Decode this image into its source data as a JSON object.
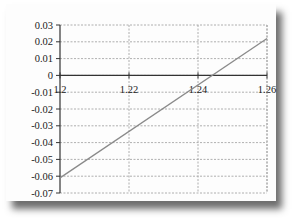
{
  "chart_data": {
    "type": "line",
    "title": "",
    "xlabel": "",
    "ylabel": "",
    "x": [
      1.2,
      1.26
    ],
    "series": [
      {
        "name": "line",
        "values": [
          -0.061,
          0.022
        ],
        "color": "#8a8a8a"
      }
    ],
    "xlim": [
      1.2,
      1.26
    ],
    "ylim": [
      -0.07,
      0.03
    ],
    "x_ticks": [
      "1.2",
      "1.22",
      "1.24",
      "1.26"
    ],
    "y_ticks": [
      "0.03",
      "0.02",
      "0.01",
      "0",
      "-0.01",
      "-0.02",
      "-0.03",
      "-0.04",
      "-0.05",
      "-0.06",
      "-0.07"
    ],
    "x_tick_values": [
      1.2,
      1.22,
      1.24,
      1.26
    ],
    "y_tick_values": [
      0.03,
      0.02,
      0.01,
      0,
      -0.01,
      -0.02,
      -0.03,
      -0.04,
      -0.05,
      -0.06,
      -0.07
    ],
    "grid": true,
    "legend": "none",
    "x_axis_position": "y=0"
  }
}
